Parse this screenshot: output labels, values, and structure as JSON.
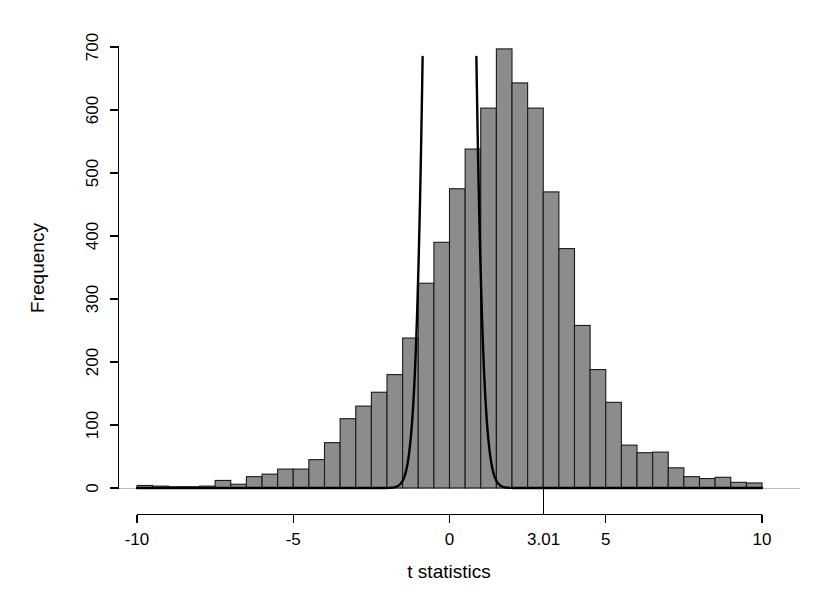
{
  "figure": {
    "width": 822,
    "height": 615,
    "background": "#ffffff"
  },
  "chart_data": {
    "type": "bar",
    "title": "",
    "subtitle": "",
    "xlabel": "t statistics",
    "ylabel": "Frequency",
    "xlim": [
      -10.5,
      10.5
    ],
    "ylim": [
      0,
      720
    ],
    "grid": false,
    "legend": null,
    "bin_width": 0.5,
    "x_ticks": [
      -10,
      -5,
      0,
      5,
      10
    ],
    "x_tick_labels": [
      "-10",
      "-5",
      "0",
      "5",
      "10"
    ],
    "y_ticks": [
      0,
      100,
      200,
      300,
      400,
      500,
      600,
      700
    ],
    "y_tick_labels": [
      "0",
      "100",
      "200",
      "300",
      "400",
      "500",
      "600",
      "700"
    ],
    "annotations": [
      {
        "name": "critical-value-marker",
        "x": 3.01,
        "label": "3.01",
        "kind": "axis-tick"
      }
    ],
    "bars": {
      "bin_left_edges": [
        -10.0,
        -9.5,
        -9.0,
        -8.5,
        -8.0,
        -7.5,
        -7.0,
        -6.5,
        -6.0,
        -5.5,
        -5.0,
        -4.5,
        -4.0,
        -3.5,
        -3.0,
        -2.5,
        -2.0,
        -1.5,
        -1.0,
        -0.5,
        0.0,
        0.5,
        1.0,
        1.5,
        2.0,
        2.5,
        3.0,
        3.5,
        4.0,
        4.5,
        5.0,
        5.5,
        6.0,
        6.5,
        7.0,
        7.5,
        8.0,
        8.5,
        9.0,
        9.5
      ],
      "bin_centers": [
        -9.75,
        -9.25,
        -8.75,
        -8.25,
        -7.75,
        -7.25,
        -6.75,
        -6.25,
        -5.75,
        -5.25,
        -4.75,
        -4.25,
        -3.75,
        -3.25,
        -2.75,
        -2.25,
        -1.75,
        -1.25,
        -0.75,
        -0.25,
        0.25,
        0.75,
        1.25,
        1.75,
        2.25,
        2.75,
        3.25,
        3.75,
        4.25,
        4.75,
        5.25,
        5.75,
        6.25,
        6.75,
        7.25,
        7.75,
        8.25,
        8.75,
        9.25,
        9.75
      ],
      "counts": [
        4,
        3,
        2,
        2,
        3,
        12,
        6,
        18,
        22,
        30,
        30,
        45,
        72,
        110,
        130,
        152,
        180,
        238,
        325,
        390,
        475,
        538,
        603,
        697,
        643,
        603,
        470,
        380,
        258,
        188,
        136,
        68,
        56,
        57,
        32,
        18,
        15,
        17,
        9,
        8
      ]
    },
    "overlay_curve": {
      "name": "reference-density-curve",
      "description": "scaled null density overlaid on histogram, clipped at plot top",
      "color": "#000000",
      "mean": 0.0,
      "sd": 0.43,
      "peak_clipped": true,
      "clip_y_value": 720,
      "x_at_clip_left": -1.03,
      "x_at_clip_right": 1.05,
      "scale_area": 5450
    }
  }
}
